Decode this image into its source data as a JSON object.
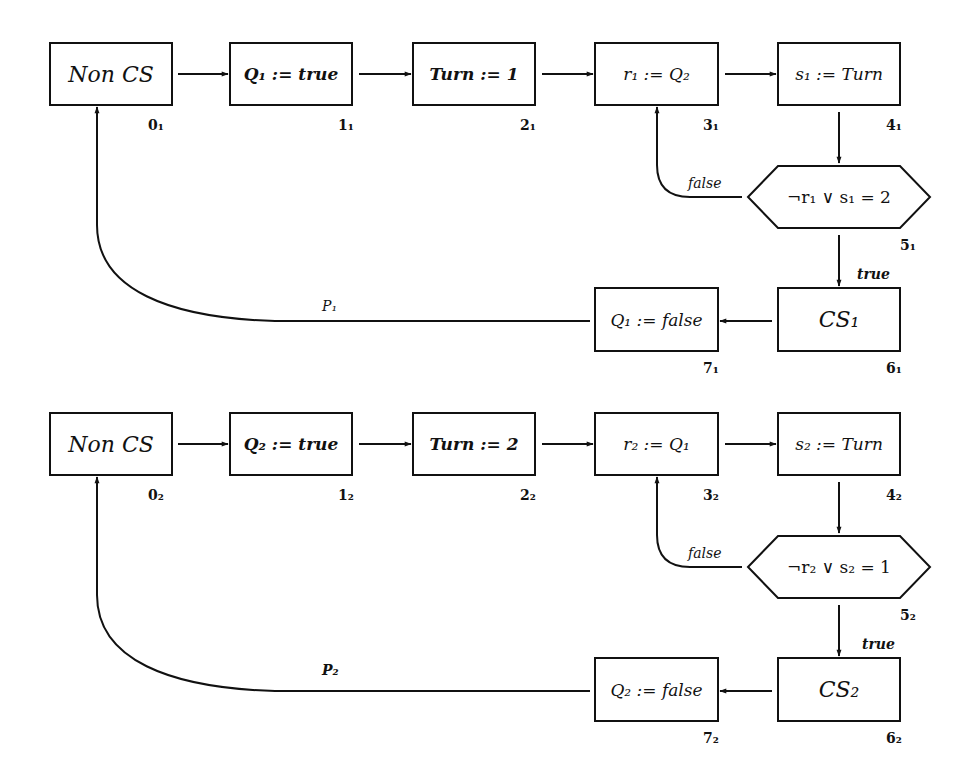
{
  "diagram": {
    "type": "flowchart",
    "processes": [
      {
        "name": "P1",
        "path_label": "P₁",
        "nodes": [
          {
            "id": "0_1",
            "text": "Non CS",
            "loc": "0₁"
          },
          {
            "id": "1_1",
            "text": "Q₁ := true",
            "loc": "1₁"
          },
          {
            "id": "2_1",
            "text": "Turn := 1",
            "loc": "2₁"
          },
          {
            "id": "3_1",
            "text": "r₁ := Q₂",
            "loc": "3₁"
          },
          {
            "id": "4_1",
            "text": "s₁ := Turn",
            "loc": "4₁"
          },
          {
            "id": "5_1",
            "text": "¬r₁ ∨ s₁ = 2",
            "loc": "5₁",
            "shape": "hexagon"
          },
          {
            "id": "6_1",
            "text": "CS₁",
            "loc": "6₁"
          },
          {
            "id": "7_1",
            "text": "Q₁ := false",
            "loc": "7₁"
          }
        ],
        "edge_labels": {
          "false": "false",
          "true": "true"
        }
      },
      {
        "name": "P2",
        "path_label": "P₂",
        "nodes": [
          {
            "id": "0_2",
            "text": "Non CS",
            "loc": "0₂"
          },
          {
            "id": "1_2",
            "text": "Q₂ := true",
            "loc": "1₂"
          },
          {
            "id": "2_2",
            "text": "Turn := 2",
            "loc": "2₂"
          },
          {
            "id": "3_2",
            "text": "r₂ := Q₁",
            "loc": "3₂"
          },
          {
            "id": "4_2",
            "text": "s₂ := Turn",
            "loc": "4₂"
          },
          {
            "id": "5_2",
            "text": "¬r₂ ∨ s₂ = 1",
            "loc": "5₂",
            "shape": "hexagon"
          },
          {
            "id": "6_2",
            "text": "CS₂",
            "loc": "6₂"
          },
          {
            "id": "7_2",
            "text": "Q₂ := false",
            "loc": "7₂"
          }
        ],
        "edge_labels": {
          "false": "false",
          "true": "true"
        }
      }
    ],
    "colors": {
      "stroke": "#111111",
      "background": "#ffffff"
    }
  }
}
